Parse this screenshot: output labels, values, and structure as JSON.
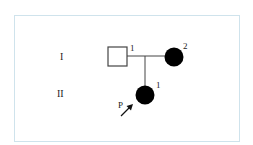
{
  "diagram": {
    "type": "pedigree",
    "generations": [
      {
        "label": "I",
        "y": 56
      },
      {
        "label": "II",
        "y": 93
      }
    ],
    "individuals": [
      {
        "id": "I-1",
        "generation": "I",
        "number": "1",
        "sex": "male",
        "affected": false,
        "shape": "square"
      },
      {
        "id": "I-2",
        "generation": "I",
        "number": "2",
        "sex": "female",
        "affected": true,
        "shape": "circle"
      },
      {
        "id": "II-1",
        "generation": "II",
        "number": "1",
        "sex": "female",
        "affected": true,
        "shape": "circle",
        "proband": true
      }
    ],
    "proband_label": "P",
    "colors": {
      "line": "#444444",
      "affected_fill": "#000000",
      "unaffected_fill": "#ffffff",
      "frame_border": "#cfe3ec"
    }
  }
}
